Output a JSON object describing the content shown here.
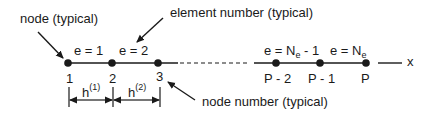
{
  "annotations": {
    "node_typical": "node (typical)",
    "element_number_typical": "element number (typical)",
    "node_number_typical": "node number (typical)"
  },
  "axis_label": "x",
  "elements": [
    {
      "prefix": "e = ",
      "value": "1"
    },
    {
      "prefix": "e = ",
      "value": "2"
    },
    {
      "prefix": "e = N",
      "sub": "e",
      "suffix": " - 1"
    },
    {
      "prefix": "e = N",
      "sub": "e",
      "suffix": ""
    }
  ],
  "nodes": [
    "1",
    "2",
    "3",
    "P - 2",
    "P - 1",
    "P"
  ],
  "lengths": [
    {
      "symbol": "h",
      "sup": "(1)"
    },
    {
      "symbol": "h",
      "sup": "(2)"
    }
  ],
  "colors": {
    "ink": "#1a1a1a",
    "background": "#ffffff"
  }
}
